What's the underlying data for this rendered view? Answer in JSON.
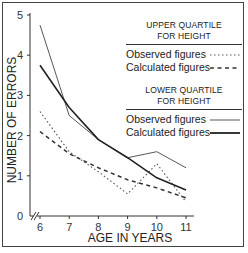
{
  "chart_data": {
    "type": "line",
    "title": "",
    "xlabel": "AGE IN YEARS",
    "ylabel": "NUMBER OF ERRORS",
    "x": [
      6,
      7,
      8,
      9,
      10,
      11
    ],
    "xticks": [
      "6",
      "7",
      "8",
      "9",
      "10",
      "11"
    ],
    "yticks": [
      "0",
      "1",
      "2",
      "3",
      "4",
      "5"
    ],
    "xlim": [
      6,
      11
    ],
    "ylim": [
      0,
      5
    ],
    "x_axis_break": true,
    "grid": false,
    "legend_position": "top-right",
    "legend_groups": [
      {
        "heading_line1": "UPPER QUARTILE",
        "heading_line2": "FOR HEIGHT",
        "entries": [
          "Observed figures",
          "Calculated figures"
        ]
      },
      {
        "heading_line1": "LOWER QUARTILE",
        "heading_line2": "FOR HEIGHT",
        "entries": [
          "Observed figures",
          "Calculated figures"
        ]
      }
    ],
    "series": [
      {
        "name": "Upper quartile for height - Observed figures",
        "style": "dotted",
        "values": [
          2.6,
          1.6,
          1.1,
          0.55,
          1.3,
          0.35
        ]
      },
      {
        "name": "Upper quartile for height - Calculated figures",
        "style": "dashed",
        "values": [
          2.1,
          1.55,
          1.2,
          0.9,
          0.7,
          0.45
        ]
      },
      {
        "name": "Lower quartile for height - Observed figures",
        "style": "thin-solid",
        "values": [
          4.75,
          2.5,
          1.9,
          1.45,
          1.6,
          1.2
        ]
      },
      {
        "name": "Lower quartile for height - Calculated figures",
        "style": "thick-solid",
        "values": [
          3.75,
          2.7,
          1.9,
          1.45,
          0.95,
          0.65
        ]
      }
    ]
  },
  "colors": {
    "ink": "#333333",
    "frame": "#444444",
    "background": "#ffffff"
  }
}
